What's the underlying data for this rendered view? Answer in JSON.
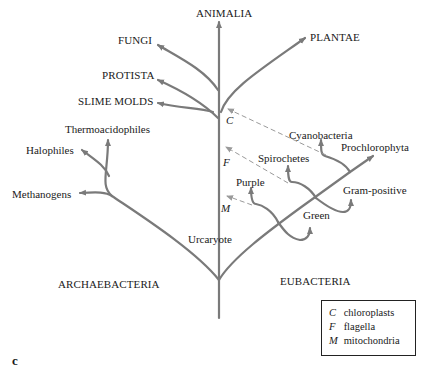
{
  "colors": {
    "branch": "#7a7a7a",
    "dashed": "#9a9a9a",
    "text": "#1a1a1a"
  },
  "kingdoms": {
    "animalia": "ANIMALIA",
    "fungi": "FUNGI",
    "plantae": "PLANTAE",
    "protista": "PROTISTA",
    "slime_molds": "SLIME MOLDS"
  },
  "archaea": {
    "group": "ARCHAEBACTERIA",
    "thermoacidophiles": "Thermoacidophiles",
    "halophiles": "Halophiles",
    "methanogens": "Methanogens"
  },
  "eubacteria": {
    "group": "EUBACTERIA",
    "cyanobacteria": "Cyanobacteria",
    "prochlorophyta": "Prochlorophyta",
    "spirochetes": "Spirochetes",
    "gram_positive": "Gram-positive",
    "purple": "Purple",
    "green": "Green"
  },
  "root": {
    "urcaryote": "Urcaryote"
  },
  "markers": {
    "c": "C",
    "f": "F",
    "m": "M"
  },
  "legend": [
    {
      "key": "C",
      "label": "chloroplasts"
    },
    {
      "key": "F",
      "label": "flagella"
    },
    {
      "key": "M",
      "label": "mitochondria"
    }
  ],
  "panel_label": "c"
}
